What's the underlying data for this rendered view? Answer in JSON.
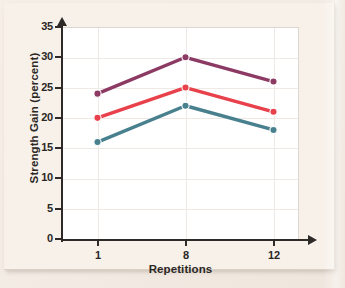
{
  "chart_data": {
    "type": "line",
    "title": "",
    "subtitle": "",
    "xlabel": "Repetitions",
    "ylabel": "Strength Gain (percent)",
    "categories": [
      "1",
      "8",
      "12"
    ],
    "x": [
      1,
      8,
      12
    ],
    "xtick_labels": [
      "1",
      "8",
      "12"
    ],
    "ytick_labels": [
      "0",
      "5",
      "10",
      "15",
      "20",
      "25",
      "30",
      "35"
    ],
    "yticks": [
      0,
      5,
      10,
      15,
      20,
      25,
      30,
      35
    ],
    "ylim": [
      0,
      35
    ],
    "grid": true,
    "grid_axis": "both",
    "legend": false,
    "legend_position": "none",
    "marker": "circle",
    "series": [
      {
        "name": "series-purple",
        "values": [
          24,
          30,
          26
        ],
        "color": "#8c3a63"
      },
      {
        "name": "series-red",
        "values": [
          20,
          25,
          21
        ],
        "color": "#e8414b"
      },
      {
        "name": "series-teal",
        "values": [
          16,
          22,
          18
        ],
        "color": "#49808e"
      }
    ],
    "annotations": []
  },
  "axes": {
    "ylabel": "Strength Gain (percent)",
    "xlabel": "Repetitions",
    "ytick_labels": [
      "35",
      "30",
      "25",
      "20",
      "15",
      "10",
      "5",
      "0"
    ],
    "xtick_labels": [
      "1",
      "8",
      "12"
    ]
  },
  "colors": {
    "paper": "#f7f1ea",
    "plot_background": "#ffffff",
    "axis": "#2d2a28",
    "grid": "#efe9e6",
    "series_purple": "#8c3a63",
    "series_red": "#e8414b",
    "series_teal": "#49808e"
  }
}
